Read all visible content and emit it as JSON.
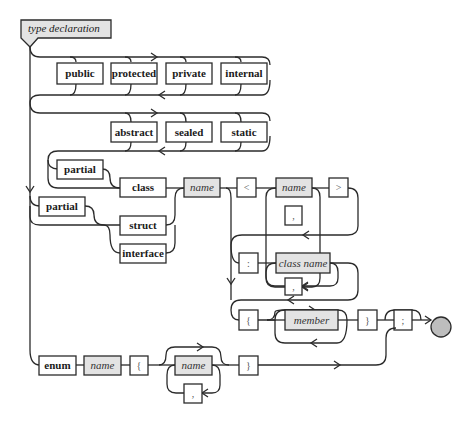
{
  "title": "type declaration",
  "colors": {
    "line": "#2b2b2b",
    "keyword_fill": "#ffffff",
    "nonterminal_fill": "#e3e3e3",
    "end_circle": "#bdbdbd"
  },
  "access_modifiers": [
    "public",
    "protected",
    "private",
    "internal"
  ],
  "class_modifiers": [
    "abstract",
    "sealed",
    "static"
  ],
  "partial_class": "partial",
  "partial_other": "partial",
  "kinds": {
    "class": "class",
    "struct": "struct",
    "interface": "interface",
    "enum": "enum"
  },
  "type_name": "name",
  "generic": {
    "open": "<",
    "param": "name",
    "separator": ",",
    "close": ">"
  },
  "base": {
    "colon": ":",
    "class_name": "class name",
    "separator": ","
  },
  "body": {
    "open": "{",
    "member": "member",
    "close": "}",
    "semicolon": ";"
  },
  "enum": {
    "name": "name",
    "open": "{",
    "value": "name",
    "separator": ",",
    "close": "}"
  }
}
